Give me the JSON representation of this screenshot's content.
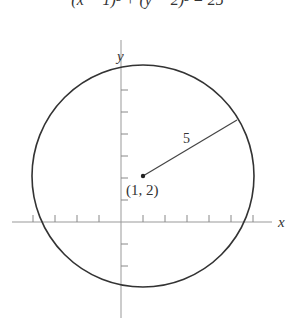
{
  "equation": "(x − 1)² + (y − 2)² = 25",
  "axes": {
    "x_label": "x",
    "y_label": "y"
  },
  "center": {
    "label": "(1, 2)",
    "x": 1,
    "y": 2
  },
  "radius": {
    "label": "5",
    "value": 5
  },
  "colors": {
    "stroke": "#333333",
    "axis": "#888888"
  }
}
